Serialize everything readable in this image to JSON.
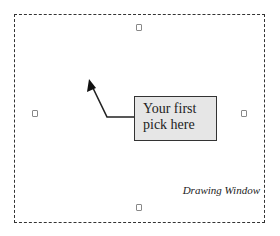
{
  "callout": {
    "line1": "Your first",
    "line2": "pick here"
  },
  "window_label": "Drawing Window",
  "handles": [
    "top-handle-icon",
    "left-handle-icon",
    "right-handle-icon",
    "bottom-handle-icon"
  ],
  "colors": {
    "border": "#333333",
    "callout_fill": "#e6e6e6"
  }
}
